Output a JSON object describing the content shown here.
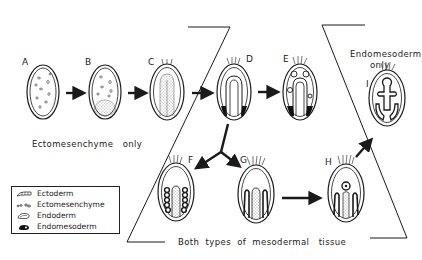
{
  "figure": {
    "stages": [
      {
        "id": "A",
        "label": "A",
        "description": "Embryo with scattered ectomesenchyme cells"
      },
      {
        "id": "B",
        "label": "B",
        "description": "Ectomesenchyme with stippled endoderm mass at base"
      },
      {
        "id": "C",
        "label": "C",
        "description": "Elongated stippled endoderm with apical tuft"
      },
      {
        "id": "D",
        "label": "D",
        "description": "U-shaped gut with endomesoderm at base"
      },
      {
        "id": "E",
        "label": "E",
        "description": "Gut with coelomic sacs and endomesoderm"
      },
      {
        "id": "F",
        "label": "F",
        "description": "Beaded endomesoderm columns flanking gut"
      },
      {
        "id": "G",
        "label": "G",
        "description": "Elongated endomesoderm bands flanking gut"
      },
      {
        "id": "H",
        "label": "H",
        "description": "Central body with bands"
      },
      {
        "id": "I",
        "label": "I",
        "description": "Cross-shaped endomesoderm structure"
      }
    ],
    "group_captions": {
      "ectomesenchyme_only": "Ectomesenchyme   only",
      "endomesoderm_only_line1": "Endomesoderm",
      "endomesoderm_only_line2": "only",
      "both_types": "Both  types  of  mesodermal   tissue"
    },
    "legend": {
      "items": [
        {
          "label": "Ectoderm",
          "symbol": "ectoderm-layer"
        },
        {
          "label": "Ectomesenchyme",
          "symbol": "scattered-cells"
        },
        {
          "label": "Endoderm",
          "symbol": "endoderm-tube"
        },
        {
          "label": "Endomesoderm",
          "symbol": "solid-black-blob"
        }
      ]
    },
    "arrows": [
      {
        "from": "A",
        "to": "B"
      },
      {
        "from": "B",
        "to": "C"
      },
      {
        "from": "C",
        "to": "D"
      },
      {
        "from": "D",
        "to": "E"
      },
      {
        "from": "D",
        "to": "F"
      },
      {
        "from": "D",
        "to": "G"
      },
      {
        "from": "G",
        "to": "H"
      },
      {
        "from": "H",
        "to": "I"
      }
    ],
    "colors": {
      "ink": "#1a1a1a",
      "background": "#ffffff"
    }
  }
}
